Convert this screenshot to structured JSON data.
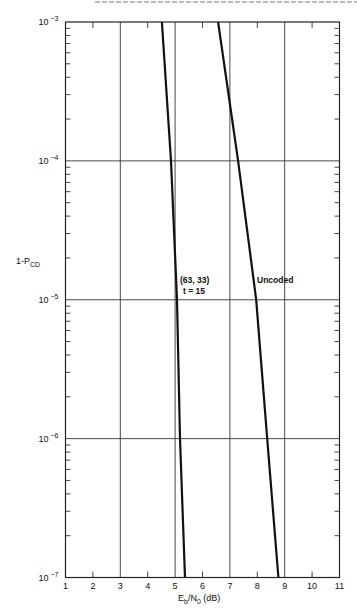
{
  "chart_data": {
    "type": "line",
    "title": "",
    "xlabel": "Eb/N0 (dB)",
    "ylabel": "1-PCD",
    "xscale": "linear",
    "yscale": "log",
    "xlim": [
      1,
      11
    ],
    "ylim": [
      1e-07,
      0.001
    ],
    "x_ticks": [
      1,
      2,
      3,
      4,
      5,
      6,
      7,
      8,
      9,
      10,
      11
    ],
    "y_ticks": [
      {
        "value": 0.001,
        "label": "10",
        "exp": "−3"
      },
      {
        "value": 0.0001,
        "label": "10",
        "exp": "−4"
      },
      {
        "value": 1e-05,
        "label": "10",
        "exp": "−5"
      },
      {
        "value": 1e-06,
        "label": "10",
        "exp": "−6"
      },
      {
        "value": 1e-07,
        "label": "10",
        "exp": "−7"
      }
    ],
    "grid": {
      "vertical_at": [
        3,
        5,
        7,
        9
      ],
      "horizontal_at": [
        0.0001,
        1e-05,
        1e-06
      ]
    },
    "series": [
      {
        "name": "(63, 33) t = 15",
        "points": [
          [
            4.52,
            0.001
          ],
          [
            4.85,
            0.0001
          ],
          [
            5.07,
            1e-05
          ],
          [
            5.18,
            1e-06
          ],
          [
            5.36,
            1e-07
          ]
        ]
      },
      {
        "name": "Uncoded",
        "points": [
          [
            6.57,
            0.001
          ],
          [
            7.3,
            0.0001
          ],
          [
            7.96,
            1e-05
          ],
          [
            8.36,
            1e-06
          ],
          [
            8.77,
            1e-07
          ]
        ]
      }
    ],
    "annotations": [
      {
        "text": "(63, 33)",
        "x": 5.1,
        "y": 1.6e-05
      },
      {
        "text": "t = 15",
        "x": 5.2,
        "y": 1.1e-05
      },
      {
        "text": "Uncoded",
        "x": 8.0,
        "y": 1.6e-05
      }
    ]
  },
  "labels": {
    "y_axis_main": "1-P",
    "y_axis_sub": "CD",
    "x_axis_e": "E",
    "x_axis_b": "b",
    "x_axis_mid": "/N",
    "x_axis_0": "0",
    "x_axis_unit": " (dB)",
    "ann_code": "(63, 33)",
    "ann_t": "t  =  15",
    "ann_uncoded": "Uncoded"
  }
}
